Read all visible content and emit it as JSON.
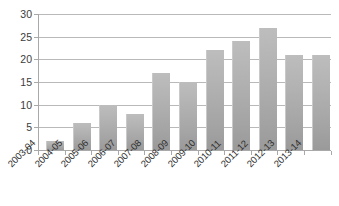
{
  "chart_data": {
    "type": "bar",
    "title": "",
    "subtitle": "",
    "xlabel": "",
    "ylabel": "",
    "categories": [
      "2003-04",
      "2004-05",
      "2005-06",
      "2006-07",
      "2007-08",
      "2008-09",
      "2009-10",
      "2010-11",
      "2011-12",
      "2012-13",
      "2013-14"
    ],
    "values": [
      2,
      6,
      10,
      8,
      17,
      15,
      22,
      24,
      27,
      21,
      21
    ],
    "series": [
      {
        "name": "",
        "values": [
          2,
          6,
          10,
          8,
          17,
          15,
          22,
          24,
          27,
          21,
          21
        ]
      }
    ],
    "ylim": [
      0,
      30
    ],
    "ytick_labels": [
      "0",
      "5",
      "10",
      "15",
      "20",
      "25",
      "30"
    ],
    "ytick_values": [
      0,
      5,
      10,
      15,
      20,
      25,
      30
    ],
    "ytick_step": 5,
    "grid": true,
    "grid_axis": "y",
    "legend": false,
    "legend_position": "none",
    "annotations": [],
    "colors": {
      "bar_top": "#bdbdbd",
      "bar_bottom": "#9a9a9a",
      "gridline": "#b9b9b9",
      "axis": "#a9a9a9",
      "tick_text": "#3c3c3c",
      "background": "#ffffff"
    }
  }
}
